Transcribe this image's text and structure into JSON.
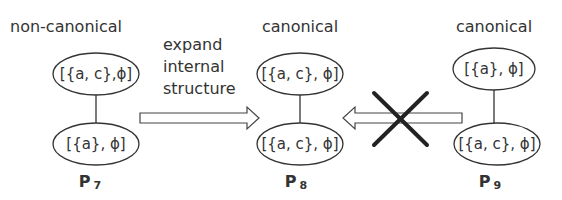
{
  "diagram": {
    "graphs": [
      {
        "id": "P7",
        "title": "non-canonical",
        "label": "P",
        "subscript": "7",
        "nodes": [
          {
            "text": "[{a, c},ϕ]"
          },
          {
            "text": "[{a},  ϕ]"
          }
        ]
      },
      {
        "id": "P8",
        "title": "canonical",
        "label": "P",
        "subscript": "8",
        "nodes": [
          {
            "text": "[{a, c}, ϕ]"
          },
          {
            "text": "[{a, c}, ϕ]"
          }
        ]
      },
      {
        "id": "P9",
        "title": "canonical",
        "label": "P",
        "subscript": "9",
        "nodes": [
          {
            "text": "[{a}, ϕ]"
          },
          {
            "text": "[{a, c}, ϕ]"
          }
        ]
      }
    ],
    "arrows": [
      {
        "from": "P7",
        "to": "P8",
        "label_lines": [
          "expand",
          "internal",
          "structure"
        ],
        "crossed": false
      },
      {
        "from": "P9",
        "to": "P8",
        "label_lines": [],
        "crossed": true
      }
    ]
  }
}
